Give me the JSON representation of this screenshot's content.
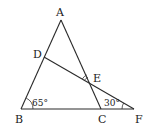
{
  "diagram": {
    "type": "geometry-triangle",
    "points": {
      "A": {
        "label": "A",
        "x": 61,
        "y": 20
      },
      "B": {
        "label": "B",
        "x": 21,
        "y": 109
      },
      "C": {
        "label": "C",
        "x": 101,
        "y": 109
      },
      "D": {
        "label": "D",
        "x": 44,
        "y": 57
      },
      "E": {
        "label": "E",
        "x": 91,
        "y": 84
      },
      "F": {
        "label": "F",
        "x": 134,
        "y": 109
      }
    },
    "segments": [
      "AB",
      "AC",
      "BF",
      "DF"
    ],
    "angles": {
      "B": {
        "label": "65°",
        "arcs": 1
      },
      "F": {
        "label": "30°",
        "arcs": 1
      },
      "AED": {
        "label": "",
        "arcs": 2
      }
    },
    "colors": {
      "stroke": "#2a2a2a",
      "background": "#ffffff"
    }
  }
}
